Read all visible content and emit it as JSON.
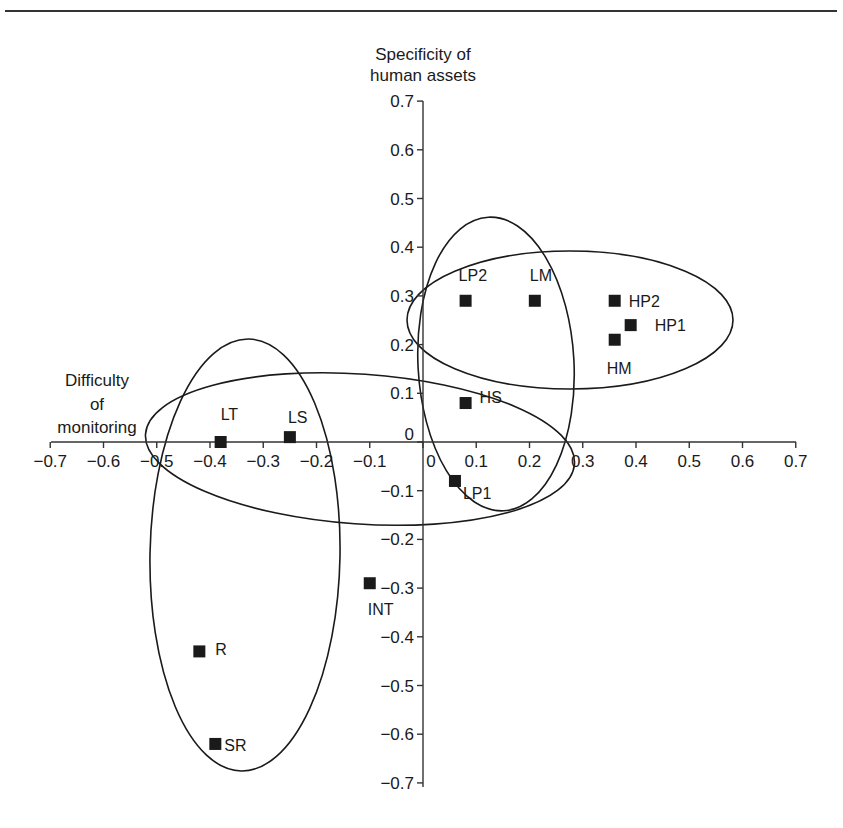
{
  "header": {
    "fragment": ""
  },
  "chart_data": {
    "type": "scatter",
    "title": "",
    "xlabel": "Difficulty of monitoring",
    "ylabel": "Specificity of human assets",
    "xlabel_lines": [
      "Difficulty",
      "of",
      "monitoring"
    ],
    "ylabel_lines": [
      "Specificity of",
      "human assets"
    ],
    "xlim": [
      -0.7,
      0.7
    ],
    "ylim": [
      -0.7,
      0.7
    ],
    "x_ticks": [
      "−0.7",
      "−0.6",
      "−0.5",
      "−0.4",
      "−0.3",
      "−0.2",
      "−0.1",
      "0",
      "0.1",
      "0.2",
      "0.3",
      "0.4",
      "0.5",
      "0.6",
      "0.7"
    ],
    "y_ticks": [
      "0.7",
      "0.6",
      "0.5",
      "0.4",
      "0.3",
      "0.2",
      "0.1",
      "0",
      "−0.1",
      "−0.2",
      "−0.3",
      "−0.4",
      "−0.5",
      "−0.6",
      "−0.7"
    ],
    "grid": false,
    "legend": null,
    "points": [
      {
        "label": "LP2",
        "x": 0.08,
        "y": 0.29
      },
      {
        "label": "LM",
        "x": 0.21,
        "y": 0.29
      },
      {
        "label": "HP2",
        "x": 0.36,
        "y": 0.29
      },
      {
        "label": "HP1",
        "x": 0.39,
        "y": 0.24
      },
      {
        "label": "HM",
        "x": 0.36,
        "y": 0.21
      },
      {
        "label": "HS",
        "x": 0.08,
        "y": 0.08
      },
      {
        "label": "LP1",
        "x": 0.06,
        "y": -0.08
      },
      {
        "label": "LT",
        "x": -0.38,
        "y": 0.0
      },
      {
        "label": "LS",
        "x": -0.25,
        "y": 0.01
      },
      {
        "label": "INT",
        "x": -0.1,
        "y": -0.29
      },
      {
        "label": "R",
        "x": -0.42,
        "y": -0.43
      },
      {
        "label": "SR",
        "x": -0.39,
        "y": -0.62
      }
    ],
    "clusters": [
      {
        "name": "top-right-horizontal",
        "members": [
          "LP2",
          "LM",
          "HP2",
          "HP1",
          "HM"
        ]
      },
      {
        "name": "center-vertical",
        "members": [
          "LP2",
          "LM",
          "HS",
          "LP1"
        ]
      },
      {
        "name": "middle-horizontal",
        "members": [
          "LT",
          "LS",
          "HS",
          "LP1"
        ]
      },
      {
        "name": "left-vertical",
        "members": [
          "LT",
          "LS",
          "R",
          "SR"
        ]
      }
    ],
    "colors": {
      "marker": "#1a1a1a",
      "axis": "#333333",
      "ellipse": "#1a1a1a"
    }
  }
}
